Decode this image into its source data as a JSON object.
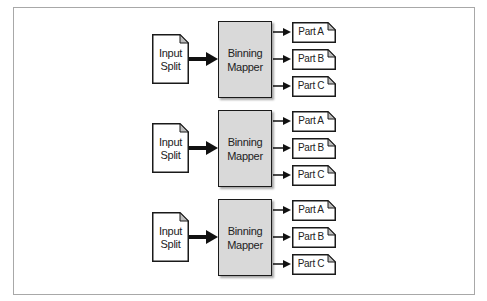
{
  "diagram": {
    "type": "flow",
    "colors": {
      "frame_border": "#a8a8a8",
      "mapper_fill": "#d9d9d9",
      "stroke": "#1a1a1a",
      "fold_fill": "#bdbdbd",
      "doc_fill": "#ffffff"
    },
    "groups": [
      {
        "input": {
          "line1": "Input",
          "line2": "Split"
        },
        "mapper": {
          "line1": "Binning",
          "line2": "Mapper"
        },
        "outputs": [
          {
            "label": "Part A"
          },
          {
            "label": "Part B"
          },
          {
            "label": "Part C"
          }
        ]
      },
      {
        "input": {
          "line1": "Input",
          "line2": "Split"
        },
        "mapper": {
          "line1": "Binning",
          "line2": "Mapper"
        },
        "outputs": [
          {
            "label": "Part A"
          },
          {
            "label": "Part B"
          },
          {
            "label": "Part C"
          }
        ]
      },
      {
        "input": {
          "line1": "Input",
          "line2": "Split"
        },
        "mapper": {
          "line1": "Binning",
          "line2": "Mapper"
        },
        "outputs": [
          {
            "label": "Part A"
          },
          {
            "label": "Part B"
          },
          {
            "label": "Part C"
          }
        ]
      }
    ],
    "edges": [
      {
        "from": "Input Split",
        "to": "Binning Mapper",
        "style": "thick-arrow"
      },
      {
        "from": "Binning Mapper",
        "to": "Part A",
        "style": "thin-arrow"
      },
      {
        "from": "Binning Mapper",
        "to": "Part B",
        "style": "thin-arrow"
      },
      {
        "from": "Binning Mapper",
        "to": "Part C",
        "style": "thin-arrow"
      }
    ]
  }
}
